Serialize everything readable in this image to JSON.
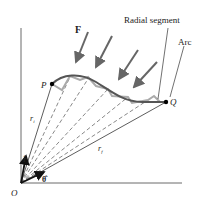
{
  "diagram": {
    "labels": {
      "force": "F",
      "radial_segment": "Radial segment",
      "arc": "Arc",
      "point_p": "P",
      "point_q": "Q",
      "origin": "O",
      "r_initial": "r",
      "r_initial_sub": "i",
      "r_final": "r",
      "r_final_sub": "f",
      "unit_r": "r̂",
      "unit_theta": "θ̂"
    },
    "colors": {
      "curve": "#555555",
      "force_arrows": "#666666",
      "step_path": "#aaaaaa",
      "lines": "#333333",
      "background": "#ffffff"
    }
  }
}
